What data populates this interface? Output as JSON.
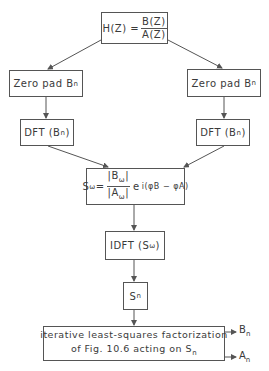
{
  "diagram": {
    "nodes": {
      "transfer_fn": {
        "lhs": "H(Z) =",
        "numerator": "B(Z)",
        "denominator": "A(Z)"
      },
      "zero_pad_left": {
        "label": "Zero pad B",
        "sub": "n"
      },
      "zero_pad_right": {
        "label": "Zero pad B",
        "sub": "n"
      },
      "dft_left": {
        "label_pre": "DFT (B",
        "sub": "n",
        "label_post": ")"
      },
      "dft_right": {
        "label_pre": "DFT (B",
        "sub": "n",
        "label_post": ")"
      },
      "spectrum": {
        "lhs": "S",
        "lhs_sub": "ω",
        "eq": "=",
        "numerator": "|B",
        "numerator_sub": "ω",
        "numerator_post": "|",
        "denominator": "|A",
        "denominator_sub": "ω",
        "denominator_post": "|",
        "exp_base": "e",
        "exponent": "i(φB − φA)"
      },
      "idft": {
        "label_pre": "IDFT (S",
        "sub": "ω",
        "label_post": ")"
      },
      "sn": {
        "label": "S",
        "sub": "n"
      },
      "factorization": {
        "line1": "iterative least-squares factorization",
        "line2": "of Fig. 10.6 acting on S",
        "line2_sub": "n"
      }
    },
    "outputs": [
      {
        "label": "B",
        "sub": "n"
      },
      {
        "label": "A",
        "sub": "n"
      }
    ],
    "colors": {
      "line": "#555555",
      "text": "#3a3a3a",
      "background": "#ffffff"
    }
  }
}
